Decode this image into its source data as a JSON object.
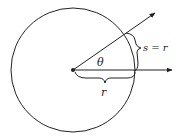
{
  "diagram": {
    "labels": {
      "angle": "θ",
      "arc": "s = r",
      "radius": "r"
    },
    "colors": {
      "stroke": "#222222",
      "background": "#ffffff"
    }
  }
}
